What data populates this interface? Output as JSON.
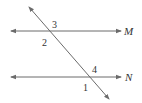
{
  "diagram": {
    "type": "parallel-lines-transversal",
    "colors": {
      "line": "#6b6b6b",
      "text": "#333333",
      "background": "#ffffff"
    },
    "lines": [
      {
        "name": "M",
        "label": "M"
      },
      {
        "name": "N",
        "label": "N"
      }
    ],
    "angles": [
      {
        "id": "3",
        "label": "3",
        "position": "above line M, right of transversal"
      },
      {
        "id": "2",
        "label": "2",
        "position": "below line M, left of transversal"
      },
      {
        "id": "4",
        "label": "4",
        "position": "above line N, right of transversal"
      },
      {
        "id": "1",
        "label": "1",
        "position": "below line N, left of transversal"
      }
    ]
  }
}
